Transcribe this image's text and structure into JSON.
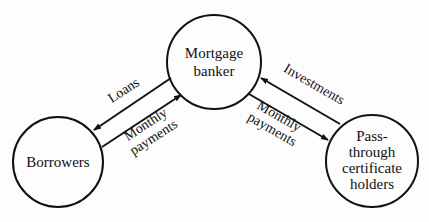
{
  "diagram": {
    "nodes": [
      {
        "id": "mortgage",
        "lines": [
          "Mortgage",
          "banker"
        ]
      },
      {
        "id": "borrowers",
        "lines": [
          "Borrowers"
        ]
      },
      {
        "id": "passthrough",
        "lines": [
          "Pass-",
          "through",
          "certificate",
          "holders"
        ]
      }
    ],
    "edges": [
      {
        "from": "mortgage",
        "to": "borrowers",
        "label": [
          "Loans"
        ]
      },
      {
        "from": "borrowers",
        "to": "mortgage",
        "label": [
          "Monthly",
          "payments"
        ]
      },
      {
        "from": "passthrough",
        "to": "mortgage",
        "label": [
          "Investments"
        ]
      },
      {
        "from": "mortgage",
        "to": "passthrough",
        "label": [
          "Monthly",
          "payments"
        ]
      }
    ]
  }
}
